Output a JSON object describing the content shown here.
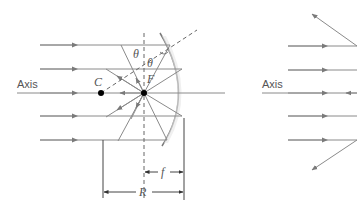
{
  "left_diagram": {
    "axis_label": "Axis",
    "center_label": "C",
    "focal_label": "F",
    "angle_incident_label": "θ",
    "angle_reflected_label": "θ",
    "focal_length_label": "f",
    "radius_label": "R"
  },
  "right_diagram": {
    "axis_label": "Axis"
  },
  "colors": {
    "ray": "#8a8a8a",
    "mirror": "#7a7a7a",
    "point": "#000000",
    "text": "#555555"
  }
}
